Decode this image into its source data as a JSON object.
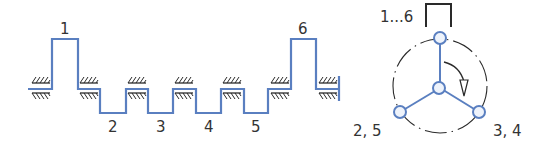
{
  "colors": {
    "crank_line": "#5a7fc0",
    "node_fill": "#eef3fb",
    "ink": "#2a2a2a",
    "label": "#333333"
  },
  "crankshaft": {
    "throws": [
      {
        "label": "1",
        "position": "up"
      },
      {
        "label": "2",
        "position": "down"
      },
      {
        "label": "3",
        "position": "down"
      },
      {
        "label": "4",
        "position": "down"
      },
      {
        "label": "5",
        "position": "down"
      },
      {
        "label": "6",
        "position": "up"
      }
    ],
    "bearing_count": 7,
    "fixed_end": "right"
  },
  "end_view": {
    "top_label": "1...6",
    "bottom_left_label": "2, 5",
    "bottom_right_label": "3, 4",
    "rotation": "clockwise"
  }
}
